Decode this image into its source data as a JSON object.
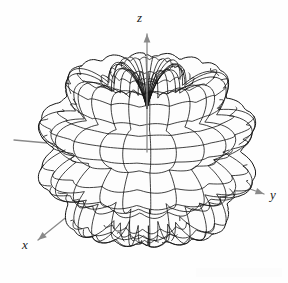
{
  "figure": {
    "kind": "3d-wireframe-surface",
    "background_color": "#fefefe",
    "width": 288,
    "height": 283
  },
  "axes": {
    "origin": {
      "x": 147,
      "y": 152
    },
    "color": "#8a8a8a",
    "line_width": 1.3,
    "items": [
      {
        "name": "z",
        "label": "z",
        "label_position": {
          "x": 137,
          "y": 11
        },
        "tip": {
          "x": 147,
          "y": 34
        },
        "has_arrow": true
      },
      {
        "name": "y",
        "label": "y",
        "label_position": {
          "x": 270,
          "y": 188
        },
        "tip": {
          "x": 264,
          "y": 194
        },
        "has_arrow": true
      },
      {
        "name": "x",
        "label": "x",
        "label_position": {
          "x": 22,
          "y": 238
        },
        "tip": {
          "x": 38,
          "y": 240
        },
        "has_arrow": true
      }
    ]
  },
  "surface": {
    "mesh_color": "#151515",
    "mesh_line_width": 0.85,
    "fill_color": "#fdfdfd",
    "center": {
      "x": 147,
      "y": 150
    },
    "radius_px": 108,
    "view": {
      "elevation_deg": 16,
      "azimuth_deg": 28,
      "projection": "orthographic"
    },
    "grid": {
      "meridians": 36,
      "parallels": 30,
      "drawn_meridians": 24,
      "drawn_parallels": 22
    },
    "pattern": {
      "model": "lobed-directivity",
      "base_radius": 0.7,
      "theta_lobes": 6,
      "theta_lobe_depth": 0.26,
      "phi_lobes": 8,
      "phi_lobe_depth": 0.085,
      "polar_null_depth": 0.3,
      "notes": "Multi-lobed spherical pattern with nulls along the z-axis at top and bottom and scalloped ripples around the equator"
    }
  },
  "chart_data": {
    "type": "surface",
    "title": "",
    "xlabel": "x",
    "ylabel": "y",
    "zlabel": "z",
    "legend": [],
    "annotations": [],
    "grid": true,
    "axis_arrows": [
      "x",
      "y",
      "z"
    ],
    "series": [
      {
        "name": "radiation-pattern-surface",
        "coordinate_system": "spherical",
        "theta_range_deg": [
          0,
          180
        ],
        "phi_range_deg": [
          0,
          360
        ],
        "radius_formula": "r(theta,phi) = 0.70 + 0.26*|sin(6*theta)| + 0.085*|sin(8*phi)|*sin(theta) - 0.30*exp(-((theta)/0.30)^2) - 0.30*exp(-((pi-theta)/0.30)^2)",
        "radius_min": 0.42,
        "radius_max": 1.0,
        "lobes_in_theta": 6,
        "lobes_in_phi": 8
      }
    ]
  }
}
